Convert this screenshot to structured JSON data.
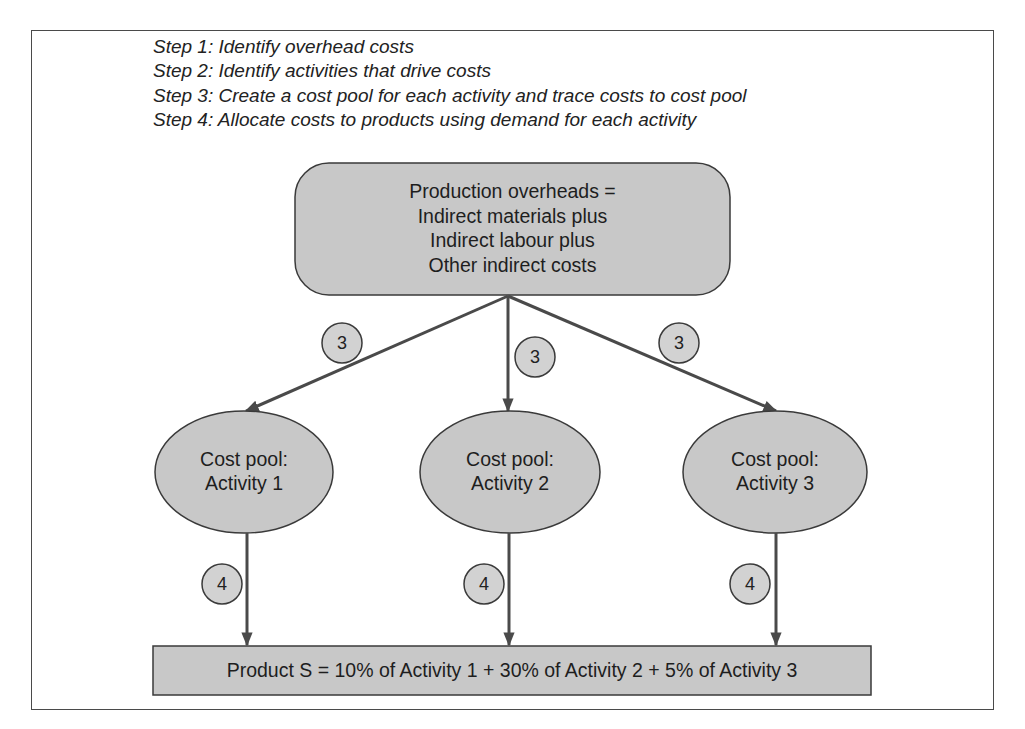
{
  "steps": [
    "Step 1: Identify overhead costs",
    "Step 2: Identify activities that drive costs",
    "Step 3: Create a cost pool for each activity and trace costs to cost pool",
    "Step 4: Allocate costs to products using demand for each activity"
  ],
  "overheads_box": {
    "lines": [
      "Production overheads =",
      "Indirect materials plus",
      "Indirect labour plus",
      "Other indirect costs"
    ]
  },
  "cost_pools": [
    {
      "line1": "Cost pool:",
      "line2": "Activity 1"
    },
    {
      "line1": "Cost pool:",
      "line2": "Activity 2"
    },
    {
      "line1": "Cost pool:",
      "line2": "Activity 3"
    }
  ],
  "step_badges": {
    "trace": [
      "3",
      "3",
      "3"
    ],
    "allocate": [
      "4",
      "4",
      "4"
    ]
  },
  "result": {
    "text": "Product S = 10% of Activity 1 + 30% of Activity 2 + 5% of Activity 3"
  },
  "colors": {
    "fill": "#c8c8c8",
    "stroke": "#3a3a3a",
    "arrow": "#4a4a4a"
  }
}
